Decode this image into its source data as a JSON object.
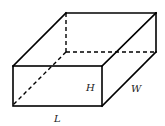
{
  "diagram": {
    "type": "rectangular-prism",
    "labels": {
      "height": "H",
      "width": "W",
      "length": "L"
    },
    "colors": {
      "stroke": "#000000",
      "label": "#222222",
      "background": "#ffffff"
    }
  }
}
